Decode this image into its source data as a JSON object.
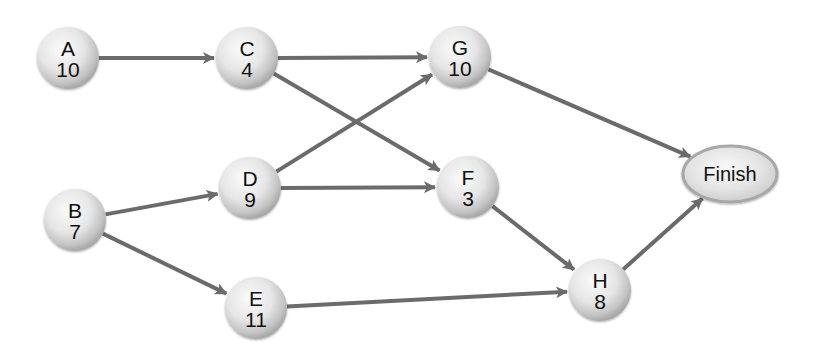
{
  "diagram": {
    "type": "activity-on-node network",
    "edge_color": "#6b6b6b",
    "node_fill_light": "#f4f4f4",
    "node_fill_dark": "#b8b8b8",
    "nodes": [
      {
        "id": "A",
        "label": "A",
        "duration": "10",
        "cx": 68,
        "cy": 58
      },
      {
        "id": "B",
        "label": "B",
        "duration": "7",
        "cx": 75,
        "cy": 220
      },
      {
        "id": "C",
        "label": "C",
        "duration": "4",
        "cx": 247,
        "cy": 58
      },
      {
        "id": "D",
        "label": "D",
        "duration": "9",
        "cx": 250,
        "cy": 188
      },
      {
        "id": "E",
        "label": "E",
        "duration": "11",
        "cx": 256,
        "cy": 308
      },
      {
        "id": "F",
        "label": "F",
        "duration": "3",
        "cx": 468,
        "cy": 187
      },
      {
        "id": "G",
        "label": "G",
        "duration": "10",
        "cx": 460,
        "cy": 57
      },
      {
        "id": "H",
        "label": "H",
        "duration": "8",
        "cx": 600,
        "cy": 290
      }
    ],
    "finish": {
      "id": "Finish",
      "label": "Finish",
      "cx": 730,
      "cy": 174
    },
    "edges": [
      {
        "from": "A",
        "to": "C"
      },
      {
        "from": "C",
        "to": "G"
      },
      {
        "from": "C",
        "to": "F"
      },
      {
        "from": "B",
        "to": "D"
      },
      {
        "from": "B",
        "to": "E"
      },
      {
        "from": "D",
        "to": "G"
      },
      {
        "from": "D",
        "to": "F"
      },
      {
        "from": "F",
        "to": "H"
      },
      {
        "from": "E",
        "to": "H"
      },
      {
        "from": "G",
        "to": "Finish"
      },
      {
        "from": "H",
        "to": "Finish"
      }
    ]
  }
}
